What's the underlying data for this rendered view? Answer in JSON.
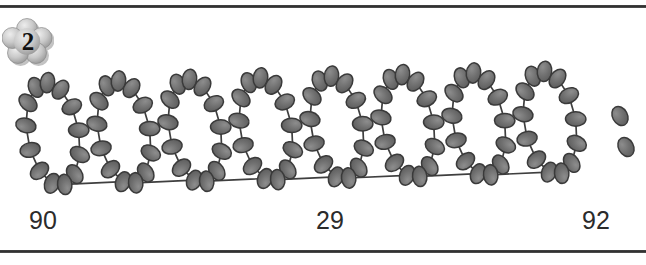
{
  "page": {
    "width": 646,
    "height": 265,
    "background": "#ffffff"
  },
  "rules": {
    "top": {
      "name": "top-divider",
      "color": "#2e2e2e",
      "y": 5
    },
    "bottom": {
      "name": "bottom-divider",
      "color": "#2e2e2e",
      "y": 250
    }
  },
  "badge": {
    "label": "2",
    "shape": "flower",
    "fill_light": "#e2e2e2",
    "fill_dark": "#9a9a9a",
    "outline": "#8c8c8c",
    "text_color": "#111111"
  },
  "artwork": {
    "name": "beaded-loop-chain",
    "description": "Row of linked beaded loops forming a cursive spiral, followed by a two-bead colon mark",
    "loop_count": 8,
    "beads_per_loop": 13,
    "trailing_marks": 2,
    "bead_fill": "#6e6e6e",
    "bead_highlight": "#8f8f8f",
    "bead_outline": "#3a3a3a",
    "thread_color": "#3f3f3f",
    "loop_start_x": 27,
    "loop_spacing_x": 71,
    "loop_rx": 26,
    "loop_ry": 52,
    "loop_tilt_deg": -10,
    "baseline_y": 84,
    "rise_per_loop": -1.6,
    "colon_beads": [
      {
        "cx": 620,
        "cy": 66,
        "rx": 7.5,
        "ry": 10,
        "rot": -28
      },
      {
        "cx": 626,
        "cy": 97,
        "rx": 7.5,
        "ry": 10,
        "rot": -28
      }
    ]
  },
  "numbers": [
    {
      "name": "number-left",
      "value": "90"
    },
    {
      "name": "number-mid",
      "value": "29"
    },
    {
      "name": "number-right",
      "value": "92"
    }
  ]
}
